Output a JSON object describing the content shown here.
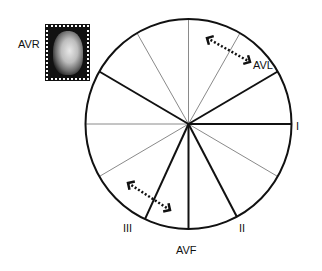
{
  "diagram": {
    "center": {
      "x": 188.5,
      "y": 124
    },
    "radius": {
      "rx": 103,
      "ry": 105
    },
    "colors": {
      "thick": "#111111",
      "thin": "#8a8a8a",
      "circle": "#111111"
    },
    "leads": [
      {
        "name": "I",
        "angle": 0,
        "weight": "thick"
      },
      {
        "name": "AVL",
        "angle": -30,
        "weight": "thick"
      },
      {
        "name": "II",
        "angle": 62,
        "weight": "thick"
      },
      {
        "name": "AVF",
        "angle": 90,
        "weight": "thick"
      },
      {
        "name": "III",
        "angle": 115,
        "weight": "thick"
      },
      {
        "name": "AVR",
        "angle": -150,
        "weight": "thick"
      }
    ],
    "thin_lines": [
      {
        "angle": 180
      },
      {
        "angle": -60
      },
      {
        "angle": -90
      },
      {
        "angle": -120
      },
      {
        "angle": 30
      },
      {
        "angle": 150
      }
    ],
    "labels": {
      "avr": "AVR",
      "avl": "AVL",
      "i": "I",
      "ii": "II",
      "iii": "III",
      "avf": "AVF"
    },
    "arrows": [
      {
        "name": "upper-double-arrow",
        "from": [
          207,
          38
        ],
        "to": [
          250,
          62
        ]
      },
      {
        "name": "lower-double-arrow",
        "from": [
          128,
          183
        ],
        "to": [
          170,
          210
        ]
      }
    ],
    "portrait": {
      "alt": "portrait-stamp"
    }
  }
}
